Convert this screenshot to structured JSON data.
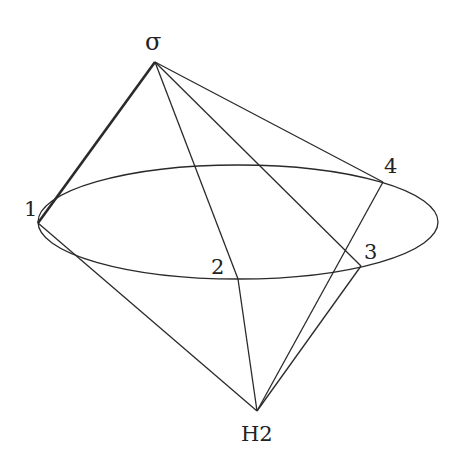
{
  "diagram": {
    "colors": {
      "stroke": "#2a2a2a",
      "label": "#222222",
      "background": "#ffffff"
    },
    "labels": {
      "apex_top": "σ",
      "apex_bottom": "H2",
      "p1": "1",
      "p2": "2",
      "p3": "3",
      "p4": "4"
    },
    "points": {
      "sigma": [
        155,
        62
      ],
      "H2": [
        257,
        411
      ],
      "p1": [
        38,
        223
      ],
      "p2": [
        238,
        279
      ],
      "p3": [
        361,
        266
      ],
      "p4": [
        383,
        182
      ]
    },
    "ellipse": {
      "cx": 238,
      "cy": 222,
      "rx": 200,
      "ry": 57
    },
    "edges": [
      [
        "sigma",
        "p1"
      ],
      [
        "sigma",
        "p2"
      ],
      [
        "sigma",
        "p3"
      ],
      [
        "sigma",
        "p4"
      ],
      [
        "H2",
        "p1"
      ],
      [
        "H2",
        "p2"
      ],
      [
        "H2",
        "p3"
      ],
      [
        "H2",
        "p4"
      ]
    ]
  }
}
